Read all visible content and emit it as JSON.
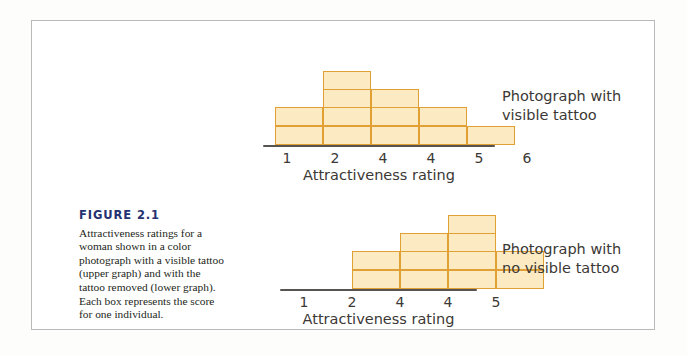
{
  "figure": {
    "number_label": "FIGURE 2.1",
    "caption": "Attractiveness ratings for a woman shown in a color photograph with a visible tattoo (upper graph) and with the tattoo removed (lower graph). Each box represents the score for one individual.",
    "number_color": "#253271",
    "frame_color": "#b9b9b9"
  },
  "colors": {
    "box_fill": "#fbeac2",
    "box_border": "#e0a033",
    "axis": "#565350",
    "text": "#3b3835"
  },
  "chart_data": [
    {
      "type": "bar",
      "id": "upper",
      "title": "Photograph with visible tattoo",
      "title_lines": "Photograph with\nvisible tattoo",
      "xlabel": "Attractiveness rating",
      "ylabel": "",
      "categories": [
        "1",
        "2",
        "4",
        "4",
        "5",
        "6"
      ],
      "values": [
        2,
        4,
        3,
        2,
        1,
        0
      ],
      "ylim": [
        0,
        4
      ],
      "grid": false,
      "legend": "none",
      "note": "Each box represents the score for one individual"
    },
    {
      "type": "bar",
      "id": "lower",
      "title": "Photograph with no visible tattoo",
      "title_lines": "Photograph with\nno visible tattoo",
      "xlabel": "Attractiveness rating",
      "ylabel": "",
      "categories": [
        "1",
        "2",
        "4",
        "4",
        "5"
      ],
      "values": [
        0,
        2,
        3,
        4,
        2
      ],
      "ylim": [
        0,
        4
      ],
      "grid": false,
      "legend": "none",
      "note": "Each box represents the score for one individual"
    }
  ]
}
